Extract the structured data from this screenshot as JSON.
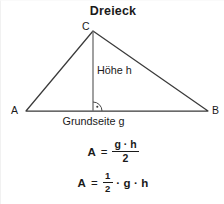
{
  "title": "Dreieck",
  "figure": {
    "vertices": [
      {
        "name": "apex",
        "label": "C",
        "x": 92,
        "y": 30
      },
      {
        "name": "left",
        "label": "A",
        "x": 25,
        "y": 110
      },
      {
        "name": "right",
        "label": "B",
        "x": 207,
        "y": 110
      }
    ],
    "height_line": {
      "label": "Höhe h",
      "from_x": 92,
      "from_y": 30,
      "to_x": 92,
      "to_y": 110
    },
    "base_line": {
      "label": "Grundseite g",
      "from_x": 25,
      "from_y": 110,
      "to_x": 207,
      "to_y": 110
    },
    "right_angle_marker": {
      "name": "right-angle",
      "x": 92,
      "y": 110,
      "radius": 9
    },
    "stroke_color": "#3a3a3a",
    "text_color": "#1a1a1a",
    "background_color": "#ffffff"
  },
  "formulas": [
    {
      "id": "area-fraction",
      "lhs": "A",
      "equals": "=",
      "numerator": "g · h",
      "denominator": "2",
      "plain": "A = (g · h) / 2"
    },
    {
      "id": "area-half",
      "lhs": "A",
      "equals": "=",
      "numerator": "1",
      "denominator": "2",
      "dot1": "·",
      "factor1": "g",
      "dot2": "·",
      "factor2": "h",
      "plain": "A = 1/2 · g · h"
    }
  ]
}
